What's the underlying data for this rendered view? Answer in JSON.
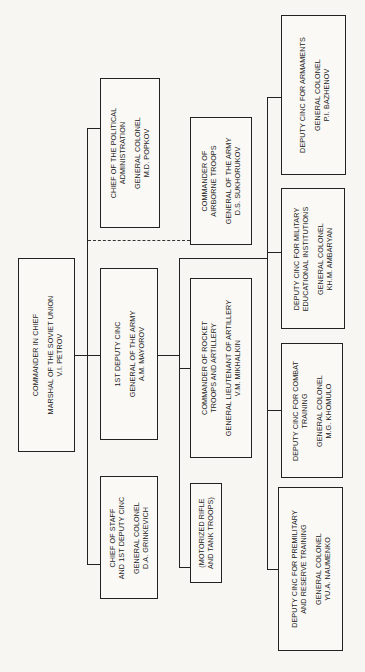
{
  "nodes": {
    "commander": {
      "title": [
        "COMMANDER IN CHIEF"
      ],
      "rank": "MARSHAL OF THE SOVIET UNION",
      "name": "V.I. PETROV"
    },
    "political": {
      "title": [
        "CHIEF OF THE POLITICAL",
        "ADMINISTRATION"
      ],
      "rank": "GENERAL COLONEL",
      "name": "M.D. POPKOV"
    },
    "first_deputy": {
      "title": [
        "1ST DEPUTY CINC"
      ],
      "rank": "GENERAL OF THE ARMY",
      "name": "A.M. MAYOROV"
    },
    "chief_of_staff": {
      "title": [
        "CHIEF OF STAFF",
        "AND 1ST DEPUTY CINC"
      ],
      "rank": "GENERAL COLONEL",
      "name": "D.A. GRINKEVICH"
    },
    "airborne": {
      "title": [
        "COMMANDER OF",
        "AIRBORNE TROOPS"
      ],
      "rank": "GENERAL OF THE ARMY",
      "name": "D.S. SUKHORUKOV"
    },
    "rocket": {
      "title": [
        "COMMANDER OF ROCKET",
        "TROOPS AND ARTILLERY"
      ],
      "rank": "GENERAL LIEUTENANT OF ARTILLERY",
      "name": "V.M. MIKHALKIN"
    },
    "motorized": {
      "title": [
        "(MOTORIZED RIFLE",
        "AND TANK TROOPS)"
      ],
      "rank": "",
      "name": ""
    },
    "armaments": {
      "title": [
        "DEPUTY CINC FOR ARMAMENTS"
      ],
      "rank": "GENERAL COLONEL",
      "name": "P.I. BAZHENOV"
    },
    "military_edu": {
      "title": [
        "DEPUTY CINC FOR MILITARY",
        "EDUCATIONAL INSTITUTIONS"
      ],
      "rank": "GENERAL COLONEL",
      "name": "KH.M. AMBARYAN"
    },
    "combat_training": {
      "title": [
        "DEPUTY CINC FOR COMBAT",
        "TRAINING"
      ],
      "rank": "GENERAL COLONEL",
      "name": "M.G. KHOMULO"
    },
    "premilitary": {
      "title": [
        "DEPUTY CINC FOR PREMILITARY",
        "AND RESERVE TRAINING"
      ],
      "rank": "GENERAL COLONEL",
      "name": "YU.A. NAUMENKO"
    }
  },
  "relations": [
    {
      "from": "commander",
      "to": "political",
      "style": "solid"
    },
    {
      "from": "commander",
      "to": "first_deputy",
      "style": "solid"
    },
    {
      "from": "commander",
      "to": "chief_of_staff",
      "style": "solid"
    },
    {
      "from": "commander",
      "to": "airborne",
      "style": "dashed"
    },
    {
      "from": "first_deputy",
      "to": "rocket",
      "style": "solid"
    },
    {
      "from": "first_deputy",
      "to": "motorized",
      "style": "solid"
    },
    {
      "from": "first_deputy",
      "to": "armaments",
      "style": "solid"
    },
    {
      "from": "first_deputy",
      "to": "military_edu",
      "style": "solid"
    },
    {
      "from": "first_deputy",
      "to": "combat_training",
      "style": "solid"
    },
    {
      "from": "first_deputy",
      "to": "premilitary",
      "style": "solid"
    }
  ]
}
